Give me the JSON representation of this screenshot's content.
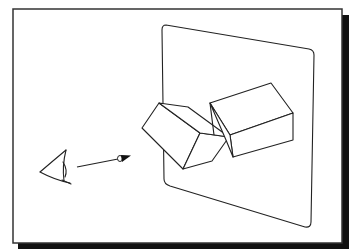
{
  "diagram": {
    "title": "",
    "colors": {
      "background": "#ffffff",
      "frame": "#333333",
      "shadow": "#111111",
      "stroke": "#222222"
    },
    "elements": {
      "eye": "eye-icon",
      "arrow": "view-direction-arrow",
      "plane": "projection-plane",
      "box_left": "left-box",
      "box_right": "right-box"
    }
  }
}
